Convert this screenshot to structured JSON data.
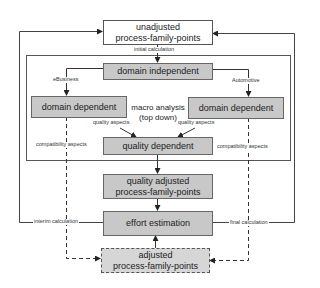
{
  "diagram": {
    "nodes": {
      "unadjusted_pfp": "unadjusted process-family-points",
      "unadjusted_pfp_line1": "unadjusted",
      "unadjusted_pfp_line2": "process-family-points",
      "domain_independent": "domain independent",
      "domain_dependent_left": "domain dependent",
      "domain_dependent_right": "domain dependent",
      "quality_dependent": "quality dependent",
      "quality_adjusted_line1": "quality adjusted",
      "quality_adjusted_line2": "process-family-points",
      "effort_estimation": "effort estimation",
      "adjusted_line1": "adjusted",
      "adjusted_line2": "process-family-points"
    },
    "group": {
      "label_line1": "macro analysis",
      "label_line2": "(top down)"
    },
    "edge_labels": {
      "initial_calculation": "initial calculation",
      "ebusiness": "eBusiness",
      "automotive": "Automotive",
      "quality_aspects_left": "quality aspects",
      "quality_aspects_right": "quality aspects",
      "compatibility_aspects_left": "compatibility aspects",
      "compatibility_aspects_right": "compatibility aspects",
      "interim_calculation": "interim calculation",
      "final_calculation": "final calculation"
    },
    "colors": {
      "box_fill": "#c8c8c8",
      "dashed_fill": "#d6d6d6",
      "line": "#444444"
    }
  }
}
